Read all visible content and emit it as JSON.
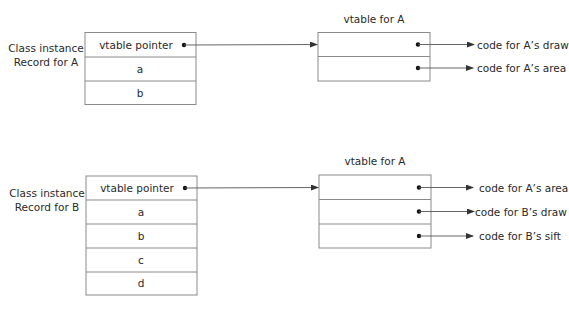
{
  "colors": {
    "line": "#555555",
    "box_border": "#8a8a8a",
    "text": "#2a2a2a",
    "dot": "#111111"
  },
  "diagrams": [
    {
      "instance_label": [
        "Class instance",
        "Record for A"
      ],
      "instance_fields": [
        "vtable pointer",
        "a",
        "b"
      ],
      "vtable_title": "vtable for A",
      "vtable_entries": [
        "code for A’s draw",
        "code for A’s area"
      ]
    },
    {
      "instance_label": [
        "Class instance",
        "Record for B"
      ],
      "instance_fields": [
        "vtable pointer",
        "a",
        "b",
        "c",
        "d"
      ],
      "vtable_title": "vtable for A",
      "vtable_entries": [
        "code for A’s area",
        "code for B’s draw",
        "code for B’s sift"
      ]
    }
  ]
}
